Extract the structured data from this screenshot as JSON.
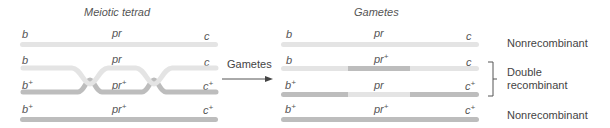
{
  "colors": {
    "light_chromosome": "#e4e4e4",
    "dark_chromosome": "#bdbdbd",
    "text": "#555555",
    "arrow": "#555555"
  },
  "left_panel": {
    "title": "Meiotic tetrad",
    "chromatids": [
      {
        "genes": [
          "b",
          "pr",
          "c"
        ],
        "plus": [
          false,
          false,
          false
        ],
        "shade": "light"
      },
      {
        "genes": [
          "b",
          "pr",
          "c"
        ],
        "plus": [
          false,
          false,
          false
        ],
        "shade": "light"
      },
      {
        "genes": [
          "b",
          "pr",
          "c"
        ],
        "plus": [
          true,
          true,
          true
        ],
        "shade": "dark"
      },
      {
        "genes": [
          "b",
          "pr",
          "c"
        ],
        "plus": [
          true,
          true,
          true
        ],
        "shade": "dark"
      }
    ],
    "crossovers": 2
  },
  "arrow": {
    "label": "Gametes"
  },
  "right_panel": {
    "title": "Gametes",
    "gametes": [
      {
        "genes": [
          "b",
          "pr",
          "c"
        ],
        "plus": [
          false,
          false,
          false
        ],
        "segments": [
          "light",
          "light",
          "light"
        ]
      },
      {
        "genes": [
          "b",
          "pr",
          "c"
        ],
        "plus": [
          false,
          true,
          false
        ],
        "segments": [
          "light",
          "dark",
          "light"
        ]
      },
      {
        "genes": [
          "b",
          "pr",
          "c"
        ],
        "plus": [
          true,
          false,
          true
        ],
        "segments": [
          "dark",
          "light",
          "dark"
        ]
      },
      {
        "genes": [
          "b",
          "pr",
          "c"
        ],
        "plus": [
          true,
          true,
          true
        ],
        "segments": [
          "dark",
          "dark",
          "dark"
        ]
      }
    ]
  },
  "classifications": [
    {
      "label": "Nonrecombinant"
    },
    {
      "label": "Double recombinant",
      "line1": "Double",
      "line2": "recombinant"
    },
    {
      "label": "Nonrecombinant"
    }
  ]
}
